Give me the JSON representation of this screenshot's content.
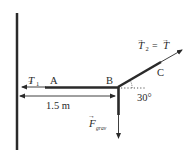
{
  "diagram": {
    "type": "free-body diagram",
    "points": {
      "A": "A",
      "B": "B",
      "C": "C"
    },
    "forces": {
      "t1": {
        "symbol": "T",
        "subscript": "1",
        "direction": "left"
      },
      "t2": {
        "symbol": "T",
        "subscript": "2",
        "equals": "=",
        "rhs": "T",
        "direction": "up-right"
      },
      "fgrav": {
        "symbol": "F",
        "subscript": "grav",
        "direction": "down"
      }
    },
    "dimension": {
      "label": "1.5 m"
    },
    "angle": {
      "label": "30°",
      "degrees": 30
    },
    "colors": {
      "line": "#2a2a2a",
      "background": "#ffffff"
    }
  }
}
